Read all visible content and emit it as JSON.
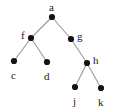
{
  "figure": {
    "kind": "binary-tree-diagram",
    "width": 118,
    "height": 110,
    "background_color": "#ffffff",
    "node_color": "#141414",
    "edge_color": "#9a9a9a",
    "label_color": "#1b1b1b",
    "node_radius": 3.1,
    "edge_width": 1.1
  },
  "tree": {
    "root": "a",
    "nodes": [
      {
        "id": "a",
        "label": "a",
        "x": 52,
        "y": 17,
        "label_x": 49,
        "label_y": 2,
        "label_pos": "above"
      },
      {
        "id": "f",
        "label": "f",
        "x": 31,
        "y": 38,
        "label_x": 21,
        "label_y": 30,
        "label_pos": "left"
      },
      {
        "id": "g",
        "label": "g",
        "x": 71,
        "y": 39,
        "label_x": 77,
        "label_y": 31,
        "label_pos": "right"
      },
      {
        "id": "c",
        "label": "c",
        "x": 14,
        "y": 61,
        "label_x": 11,
        "label_y": 70,
        "label_pos": "below"
      },
      {
        "id": "d",
        "label": "d",
        "x": 47,
        "y": 62,
        "label_x": 44,
        "label_y": 71,
        "label_pos": "below"
      },
      {
        "id": "h",
        "label": "h",
        "x": 87,
        "y": 63,
        "label_x": 93,
        "label_y": 55,
        "label_pos": "right"
      },
      {
        "id": "j",
        "label": "j",
        "x": 75,
        "y": 87,
        "label_x": 73,
        "label_y": 96,
        "label_pos": "below"
      },
      {
        "id": "k",
        "label": "k",
        "x": 101,
        "y": 88,
        "label_x": 98,
        "label_y": 97,
        "label_pos": "below"
      }
    ],
    "edges": [
      {
        "from": "a",
        "to": "f"
      },
      {
        "from": "a",
        "to": "g"
      },
      {
        "from": "f",
        "to": "c"
      },
      {
        "from": "f",
        "to": "d"
      },
      {
        "from": "g",
        "to": "h"
      },
      {
        "from": "h",
        "to": "j"
      },
      {
        "from": "h",
        "to": "k"
      }
    ]
  }
}
